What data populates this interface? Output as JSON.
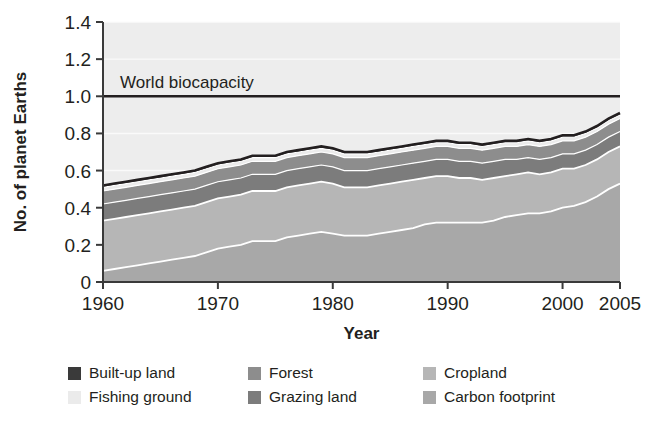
{
  "chart_data": {
    "type": "area",
    "stacked": true,
    "title": "",
    "xlabel": "Year",
    "ylabel": "No. of planet Earths",
    "xlim": [
      1960,
      2005
    ],
    "ylim": [
      0,
      1.4
    ],
    "grid": true,
    "legend_position": "bottom",
    "xticks": [
      1960,
      1970,
      1980,
      1990,
      2000,
      2005
    ],
    "xtick_labels": [
      "1960",
      "1970",
      "1980",
      "1990",
      "2000",
      "2005"
    ],
    "yticks": [
      0,
      0.2,
      0.4,
      0.6,
      0.8,
      1.0,
      1.2,
      1.4
    ],
    "ytick_labels": [
      "0",
      "0.2",
      "0.4",
      "0.6",
      "0.8",
      "1.0",
      "1.2",
      "1.4"
    ],
    "x": [
      1960,
      1961,
      1962,
      1963,
      1964,
      1965,
      1966,
      1967,
      1968,
      1969,
      1970,
      1971,
      1972,
      1973,
      1974,
      1975,
      1976,
      1977,
      1978,
      1979,
      1980,
      1981,
      1982,
      1983,
      1984,
      1985,
      1986,
      1987,
      1988,
      1989,
      1990,
      1991,
      1992,
      1993,
      1994,
      1995,
      1996,
      1997,
      1998,
      1999,
      2000,
      2001,
      2002,
      2003,
      2004,
      2005
    ],
    "series": [
      {
        "name": "Carbon footprint",
        "color": "#a8a8a8",
        "values": [
          0.06,
          0.07,
          0.08,
          0.09,
          0.1,
          0.11,
          0.12,
          0.13,
          0.14,
          0.16,
          0.18,
          0.19,
          0.2,
          0.22,
          0.22,
          0.22,
          0.24,
          0.25,
          0.26,
          0.27,
          0.26,
          0.25,
          0.25,
          0.25,
          0.26,
          0.27,
          0.28,
          0.29,
          0.31,
          0.32,
          0.32,
          0.32,
          0.32,
          0.32,
          0.33,
          0.35,
          0.36,
          0.37,
          0.37,
          0.38,
          0.4,
          0.41,
          0.43,
          0.46,
          0.5,
          0.53
        ]
      },
      {
        "name": "Cropland",
        "color": "#b6b6b6",
        "values": [
          0.27,
          0.27,
          0.27,
          0.27,
          0.27,
          0.27,
          0.27,
          0.27,
          0.27,
          0.27,
          0.27,
          0.27,
          0.27,
          0.27,
          0.27,
          0.27,
          0.27,
          0.27,
          0.27,
          0.27,
          0.27,
          0.26,
          0.26,
          0.26,
          0.26,
          0.26,
          0.26,
          0.26,
          0.25,
          0.25,
          0.25,
          0.24,
          0.24,
          0.23,
          0.23,
          0.22,
          0.22,
          0.22,
          0.21,
          0.21,
          0.21,
          0.2,
          0.2,
          0.2,
          0.2,
          0.2
        ]
      },
      {
        "name": "Grazing land",
        "color": "#7c7c7c",
        "values": [
          0.09,
          0.09,
          0.09,
          0.09,
          0.09,
          0.09,
          0.09,
          0.09,
          0.09,
          0.09,
          0.09,
          0.09,
          0.09,
          0.09,
          0.09,
          0.09,
          0.09,
          0.09,
          0.09,
          0.09,
          0.09,
          0.09,
          0.09,
          0.09,
          0.09,
          0.09,
          0.09,
          0.09,
          0.09,
          0.09,
          0.09,
          0.09,
          0.09,
          0.09,
          0.09,
          0.09,
          0.08,
          0.08,
          0.08,
          0.08,
          0.08,
          0.08,
          0.08,
          0.08,
          0.08,
          0.08
        ]
      },
      {
        "name": "Forest",
        "color": "#8d8d8d",
        "values": [
          0.07,
          0.07,
          0.07,
          0.07,
          0.07,
          0.07,
          0.07,
          0.07,
          0.07,
          0.07,
          0.07,
          0.07,
          0.07,
          0.07,
          0.07,
          0.07,
          0.07,
          0.07,
          0.07,
          0.07,
          0.07,
          0.07,
          0.07,
          0.07,
          0.07,
          0.07,
          0.07,
          0.07,
          0.07,
          0.07,
          0.07,
          0.07,
          0.07,
          0.07,
          0.07,
          0.07,
          0.07,
          0.07,
          0.07,
          0.07,
          0.07,
          0.07,
          0.07,
          0.07,
          0.07,
          0.07
        ]
      },
      {
        "name": "Fishing ground",
        "color": "#ebebeb",
        "values": [
          0.02,
          0.02,
          0.02,
          0.02,
          0.02,
          0.02,
          0.02,
          0.02,
          0.02,
          0.02,
          0.02,
          0.02,
          0.02,
          0.02,
          0.02,
          0.02,
          0.02,
          0.02,
          0.02,
          0.02,
          0.02,
          0.02,
          0.02,
          0.02,
          0.02,
          0.02,
          0.02,
          0.02,
          0.02,
          0.02,
          0.02,
          0.02,
          0.02,
          0.02,
          0.02,
          0.02,
          0.02,
          0.02,
          0.02,
          0.02,
          0.02,
          0.02,
          0.02,
          0.02,
          0.02,
          0.02
        ]
      },
      {
        "name": "Built-up land",
        "color": "#3a3a3a",
        "values": [
          0.01,
          0.01,
          0.01,
          0.01,
          0.01,
          0.01,
          0.01,
          0.01,
          0.01,
          0.01,
          0.01,
          0.01,
          0.01,
          0.01,
          0.01,
          0.01,
          0.01,
          0.01,
          0.01,
          0.01,
          0.01,
          0.01,
          0.01,
          0.01,
          0.01,
          0.01,
          0.01,
          0.01,
          0.01,
          0.01,
          0.01,
          0.01,
          0.01,
          0.01,
          0.01,
          0.01,
          0.01,
          0.01,
          0.01,
          0.01,
          0.01,
          0.01,
          0.01,
          0.01,
          0.01,
          0.01
        ]
      }
    ],
    "totals": [
      0.52,
      0.53,
      0.54,
      0.55,
      0.56,
      0.57,
      0.58,
      0.59,
      0.6,
      0.62,
      0.64,
      0.65,
      0.66,
      0.68,
      0.68,
      0.68,
      0.7,
      0.71,
      0.72,
      0.73,
      0.72,
      0.7,
      0.7,
      0.7,
      0.71,
      0.72,
      0.73,
      0.74,
      0.75,
      0.76,
      0.76,
      0.75,
      0.75,
      0.74,
      0.75,
      0.76,
      0.76,
      0.77,
      0.76,
      0.77,
      0.79,
      0.79,
      0.81,
      0.84,
      0.88,
      0.91
    ],
    "annotations": [
      {
        "text": "World biocapacity",
        "y": 1.0,
        "type": "reference-line",
        "color": "#231f20"
      }
    ]
  },
  "legend": {
    "items": [
      {
        "label": "Built-up land",
        "color": "#3a3a3a"
      },
      {
        "label": "Forest",
        "color": "#8d8d8d"
      },
      {
        "label": "Cropland",
        "color": "#b6b6b6"
      },
      {
        "label": "Fishing ground",
        "color": "#ebebeb"
      },
      {
        "label": "Grazing land",
        "color": "#7c7c7c"
      },
      {
        "label": "Carbon footprint",
        "color": "#a8a8a8"
      }
    ]
  },
  "style": {
    "plot_background": "#ededed",
    "axis_color": "#3a3a3a",
    "text_color": "#231f20",
    "gridline_color": "#fdfdfd"
  }
}
